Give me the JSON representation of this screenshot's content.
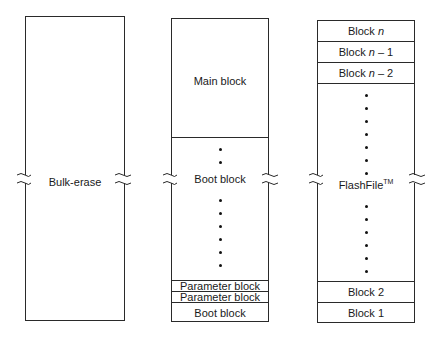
{
  "columns": [
    {
      "name": "bulk-erase",
      "label": "Bulk-erase"
    },
    {
      "name": "boot-block",
      "main_label": "Main block",
      "middle_label": "Boot block",
      "parameter_block_1": "Parameter block",
      "parameter_block_2": "Parameter block",
      "bottom_label": "Boot block"
    },
    {
      "name": "flashfile",
      "block_n_prefix": "Block ",
      "block_n_var": "n",
      "block_n1_prefix": "Block ",
      "block_n1_var": "n",
      "block_n1_suffix": " – 1",
      "block_n2_prefix": "Block ",
      "block_n2_var": "n",
      "block_n2_suffix": " – 2",
      "middle_label": "FlashFile",
      "middle_label_sup": "TM",
      "block_2": "Block 2",
      "block_1": "Block 1"
    }
  ]
}
